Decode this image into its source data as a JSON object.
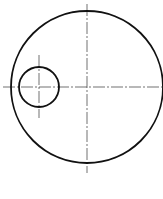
{
  "drawing": {
    "type": "technical-drawing",
    "canvas": {
      "width": 163,
      "height": 199,
      "background": "#ffffff"
    },
    "line_color": "#111111",
    "shapes": [
      {
        "name": "large-circle",
        "cx": 87,
        "cy": 87,
        "r": 76
      },
      {
        "name": "small-circle",
        "cx": 39,
        "cy": 87,
        "r": 20
      }
    ],
    "centerlines": [
      {
        "name": "main-horizontal",
        "x1": 3,
        "y1": 87,
        "x2": 163,
        "y2": 87
      },
      {
        "name": "main-vertical",
        "x1": 87,
        "y1": 4,
        "x2": 87,
        "y2": 173
      },
      {
        "name": "small-vertical",
        "x1": 39,
        "y1": 55,
        "x2": 39,
        "y2": 118
      }
    ]
  }
}
